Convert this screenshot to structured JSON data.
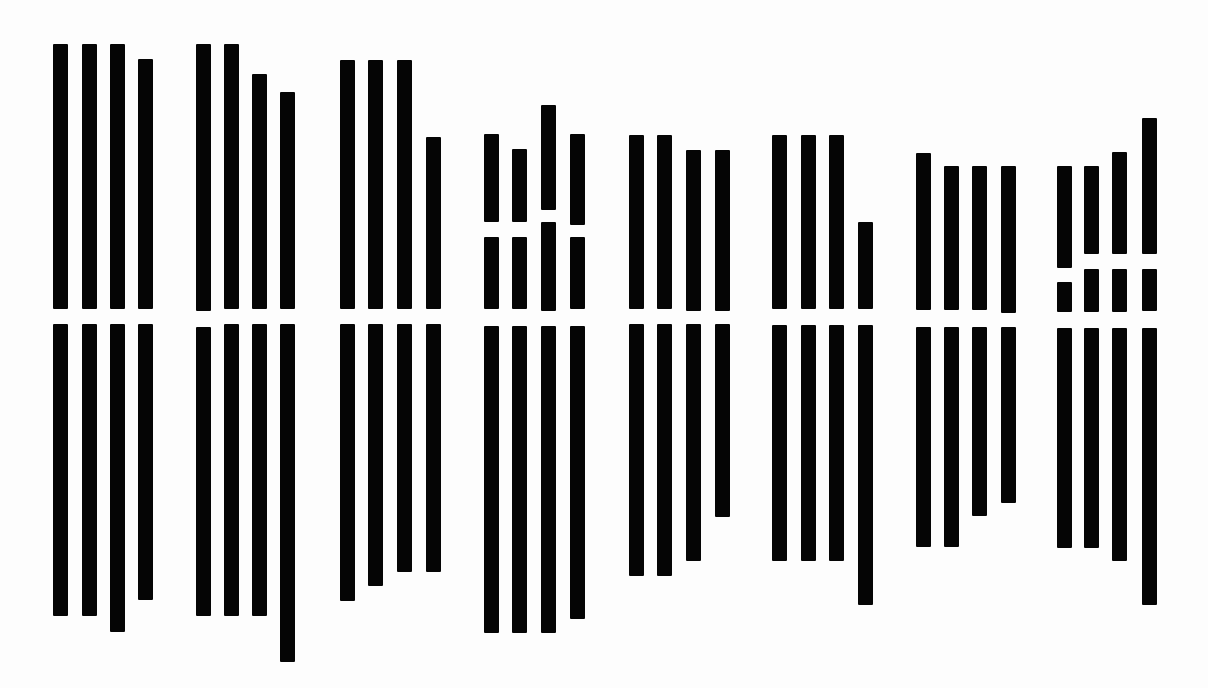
{
  "figure": {
    "background": "#fdfdfd",
    "bar_color": "#050505",
    "bar_width": 15,
    "gap_band": [
      310,
      324
    ]
  },
  "chart_data": {
    "type": "bar",
    "title": "",
    "xlabel": "",
    "ylabel": "",
    "grid": false,
    "legend": "none",
    "groups": [
      {
        "name": "group-1",
        "bars": [
          {
            "x": 53,
            "segments": [
              [
                44,
                309
              ],
              [
                324,
                616
              ]
            ]
          },
          {
            "x": 82,
            "segments": [
              [
                44,
                309
              ],
              [
                324,
                616
              ]
            ]
          },
          {
            "x": 110,
            "segments": [
              [
                44,
                309
              ],
              [
                324,
                632
              ]
            ]
          },
          {
            "x": 138,
            "segments": [
              [
                59,
                309
              ],
              [
                324,
                600
              ]
            ]
          }
        ]
      },
      {
        "name": "group-2",
        "bars": [
          {
            "x": 196,
            "segments": [
              [
                44,
                311
              ],
              [
                327,
                616
              ]
            ]
          },
          {
            "x": 224,
            "segments": [
              [
                44,
                309
              ],
              [
                324,
                616
              ]
            ]
          },
          {
            "x": 252,
            "segments": [
              [
                74,
                309
              ],
              [
                324,
                616
              ]
            ]
          },
          {
            "x": 280,
            "segments": [
              [
                92,
                309
              ],
              [
                324,
                662
              ]
            ]
          }
        ]
      },
      {
        "name": "group-3",
        "bars": [
          {
            "x": 340,
            "segments": [
              [
                60,
                309
              ],
              [
                324,
                601
              ]
            ]
          },
          {
            "x": 368,
            "segments": [
              [
                60,
                309
              ],
              [
                324,
                586
              ]
            ]
          },
          {
            "x": 397,
            "segments": [
              [
                60,
                309
              ],
              [
                324,
                572
              ]
            ]
          },
          {
            "x": 426,
            "segments": [
              [
                137,
                309
              ],
              [
                324,
                572
              ]
            ]
          }
        ]
      },
      {
        "name": "group-4",
        "bars": [
          {
            "x": 484,
            "segments": [
              [
                134,
                222
              ],
              [
                237,
                309
              ],
              [
                326,
                633
              ]
            ]
          },
          {
            "x": 512,
            "segments": [
              [
                149,
                222
              ],
              [
                237,
                309
              ],
              [
                326,
                633
              ]
            ]
          },
          {
            "x": 541,
            "segments": [
              [
                105,
                210
              ],
              [
                222,
                311
              ],
              [
                326,
                633
              ]
            ]
          },
          {
            "x": 570,
            "segments": [
              [
                134,
                225
              ],
              [
                237,
                309
              ],
              [
                326,
                619
              ]
            ]
          }
        ]
      },
      {
        "name": "group-5",
        "bars": [
          {
            "x": 629,
            "segments": [
              [
                135,
                309
              ],
              [
                324,
                576
              ]
            ]
          },
          {
            "x": 657,
            "segments": [
              [
                135,
                309
              ],
              [
                324,
                576
              ]
            ]
          },
          {
            "x": 686,
            "segments": [
              [
                150,
                311
              ],
              [
                324,
                561
              ]
            ]
          },
          {
            "x": 715,
            "segments": [
              [
                150,
                311
              ],
              [
                324,
                517
              ]
            ]
          }
        ]
      },
      {
        "name": "group-6",
        "bars": [
          {
            "x": 772,
            "segments": [
              [
                135,
                309
              ],
              [
                325,
                561
              ]
            ]
          },
          {
            "x": 801,
            "segments": [
              [
                135,
                309
              ],
              [
                325,
                561
              ]
            ]
          },
          {
            "x": 829,
            "segments": [
              [
                135,
                309
              ],
              [
                325,
                561
              ]
            ]
          },
          {
            "x": 858,
            "segments": [
              [
                222,
                309
              ],
              [
                325,
                605
              ]
            ]
          }
        ]
      },
      {
        "name": "group-7",
        "bars": [
          {
            "x": 916,
            "segments": [
              [
                153,
                310
              ],
              [
                327,
                547
              ]
            ]
          },
          {
            "x": 944,
            "segments": [
              [
                166,
                310
              ],
              [
                327,
                547
              ]
            ]
          },
          {
            "x": 972,
            "segments": [
              [
                166,
                310
              ],
              [
                327,
                516
              ]
            ]
          },
          {
            "x": 1001,
            "segments": [
              [
                166,
                313
              ],
              [
                327,
                503
              ]
            ]
          }
        ]
      },
      {
        "name": "group-8",
        "bars": [
          {
            "x": 1057,
            "segments": [
              [
                166,
                268
              ],
              [
                282,
                312
              ],
              [
                328,
                548
              ]
            ]
          },
          {
            "x": 1084,
            "segments": [
              [
                166,
                254
              ],
              [
                269,
                312
              ],
              [
                328,
                548
              ]
            ]
          },
          {
            "x": 1112,
            "segments": [
              [
                152,
                254
              ],
              [
                269,
                312
              ],
              [
                328,
                561
              ]
            ]
          },
          {
            "x": 1142,
            "segments": [
              [
                118,
                254
              ],
              [
                269,
                311
              ],
              [
                328,
                605
              ]
            ]
          }
        ]
      }
    ]
  }
}
